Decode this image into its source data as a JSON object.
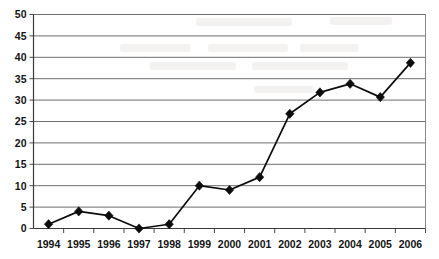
{
  "chart_data": {
    "type": "line",
    "title": "",
    "subtitle": "",
    "xlabel": "",
    "ylabel": "",
    "categories": [
      "1994",
      "1995",
      "1996",
      "1997",
      "1998",
      "1999",
      "2000",
      "2001",
      "2002",
      "2003",
      "2004",
      "2005",
      "2006"
    ],
    "values": [
      1,
      4,
      3,
      0,
      1,
      10,
      9,
      12,
      26.8,
      31.8,
      33.8,
      30.7,
      38.7
    ],
    "series": [
      {
        "name": "",
        "values": [
          1,
          4,
          3,
          0,
          1,
          10,
          9,
          12,
          26.8,
          31.8,
          33.8,
          30.7,
          38.7
        ]
      }
    ],
    "ylim": [
      0,
      50
    ],
    "ytick_labels": [
      "0",
      "5",
      "10",
      "15",
      "20",
      "25",
      "30",
      "35",
      "40",
      "45",
      "50"
    ],
    "ytick_values": [
      0,
      5,
      10,
      15,
      20,
      25,
      30,
      35,
      40,
      45,
      50
    ],
    "xtick_labels": [
      "1994",
      "1995",
      "1996",
      "1997",
      "1998",
      "1999",
      "2000",
      "2001",
      "2002",
      "2003",
      "2004",
      "2005",
      "2006"
    ],
    "grid": true,
    "grid_orientation": "horizontal",
    "legend": false,
    "legend_position": "none",
    "marker": "diamond",
    "annotations": []
  },
  "style": {
    "line_color": "#0d0d0d",
    "marker_color": "#0d0d0d",
    "grid_color": "#6e6e6e",
    "axis_color": "#3a3a3a",
    "text_color": "#141414",
    "background_color": "#ffffff"
  }
}
